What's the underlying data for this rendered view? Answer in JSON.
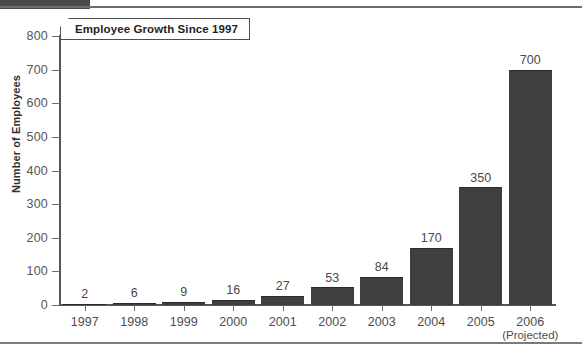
{
  "page": {
    "background_color": "#ffffff",
    "rule_color": "#6e6e6e",
    "tab_color": "#4a4a4a"
  },
  "chart_data": {
    "type": "bar",
    "title": "Employee Growth Since 1997",
    "xlabel": "",
    "ylabel": "Number of Employees",
    "categories": [
      "1997",
      "1998",
      "1999",
      "2000",
      "2001",
      "2002",
      "2003",
      "2004",
      "2005",
      "2006"
    ],
    "category_sublabels": [
      "",
      "",
      "",
      "",
      "",
      "",
      "",
      "",
      "",
      "(Projected)"
    ],
    "values": [
      2,
      6,
      9,
      16,
      27,
      53,
      84,
      170,
      350,
      700
    ],
    "value_labels": [
      "2",
      "6",
      "9",
      "16",
      "27",
      "53",
      "84",
      "170",
      "350",
      "700"
    ],
    "ylim": [
      0,
      800
    ],
    "yticks": [
      0,
      100,
      200,
      300,
      400,
      500,
      600,
      700,
      800
    ],
    "ytick_labels": [
      "0",
      "100",
      "200",
      "300",
      "400",
      "500",
      "600",
      "700",
      "800"
    ],
    "grid": false,
    "legend": false,
    "bar_color": "#3f3f3f",
    "axis_color": "#555555",
    "text_color": "#4d4d4d"
  }
}
